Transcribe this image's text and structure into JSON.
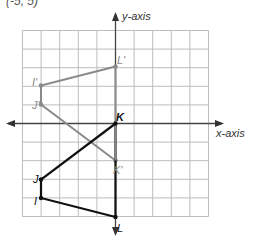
{
  "fragment_text": "(-5, 5)",
  "axes": {
    "x_label": "x-axis",
    "y_label": "y-axis"
  },
  "grid": {
    "x_min": -5,
    "x_max": 5,
    "y_min": -5,
    "y_max": 5,
    "color": "#bdbdbd"
  },
  "figures": {
    "original": {
      "color": "#111111",
      "vertices": [
        {
          "name": "K",
          "x": 0,
          "y": 0
        },
        {
          "name": "J",
          "x": -4,
          "y": -3
        },
        {
          "name": "I",
          "x": -4,
          "y": -4
        },
        {
          "name": "L",
          "x": 0,
          "y": -5
        }
      ]
    },
    "image": {
      "color": "#8a8a8a",
      "vertices": [
        {
          "name": "K'",
          "x": 0,
          "y": -2
        },
        {
          "name": "J'",
          "x": -4,
          "y": 1
        },
        {
          "name": "I'",
          "x": -4,
          "y": 2
        },
        {
          "name": "L'",
          "x": 0,
          "y": 3
        }
      ]
    }
  },
  "labels": {
    "K": "K",
    "J": "J",
    "I": "I",
    "L": "L",
    "K_prime": "K'",
    "J_prime": "J'",
    "I_prime": "I'",
    "L_prime": "L'"
  }
}
